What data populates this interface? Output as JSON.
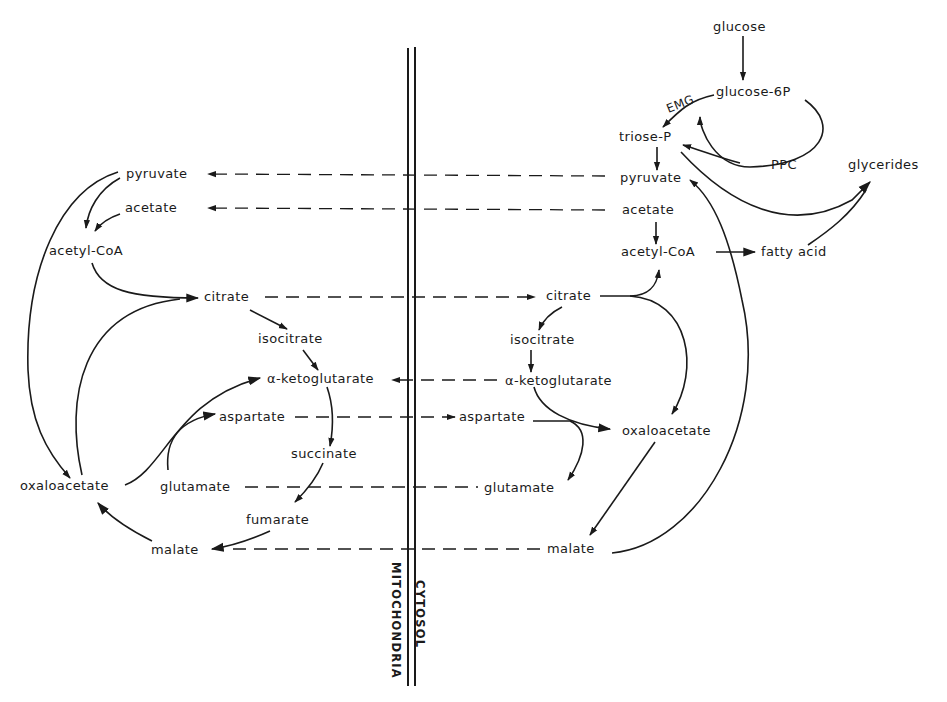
{
  "diagram": {
    "compartments": {
      "left_label": "MITOCHONDRIA",
      "right_label": "CYTOSOL"
    },
    "mitochondria": {
      "pyruvate": "pyruvate",
      "acetate": "acetate",
      "acetyl_coa": "acetyl-CoA",
      "citrate": "citrate",
      "isocitrate": "isocitrate",
      "alpha_ketoglutarate": "α-ketoglutarate",
      "aspartate": "aspartate",
      "succinate": "succinate",
      "oxaloacetate": "oxaloacetate",
      "glutamate": "glutamate",
      "fumarate": "fumarate",
      "malate": "malate"
    },
    "cytosol": {
      "glucose": "glucose",
      "glucose_6p": "glucose-6P",
      "emg": "EMG",
      "triose_p": "triose-P",
      "ppc": "PPC",
      "glycerides": "glycerides",
      "pyruvate": "pyruvate",
      "acetate": "acetate",
      "acetyl_coa": "acetyl-CoA",
      "fatty_acid": "fatty acid",
      "citrate": "citrate",
      "isocitrate": "isocitrate",
      "alpha_ketoglutarate": "α-ketoglutarate",
      "aspartate": "aspartate",
      "oxaloacetate": "oxaloacetate",
      "glutamate": "glutamate",
      "malate": "malate"
    },
    "transport_links": [
      {
        "metabolite": "pyruvate",
        "direction": "cytosol-to-mitochondria"
      },
      {
        "metabolite": "acetate",
        "direction": "cytosol-to-mitochondria"
      },
      {
        "metabolite": "citrate",
        "direction": "mitochondria-to-cytosol"
      },
      {
        "metabolite": "α-ketoglutarate",
        "direction": "cytosol-to-mitochondria"
      },
      {
        "metabolite": "aspartate",
        "direction": "mitochondria-to-cytosol"
      },
      {
        "metabolite": "glutamate",
        "direction": "exchange"
      },
      {
        "metabolite": "malate",
        "direction": "cytosol-to-mitochondria"
      }
    ],
    "colors": {
      "ink": "#1a1a1a",
      "background": "#ffffff"
    }
  }
}
